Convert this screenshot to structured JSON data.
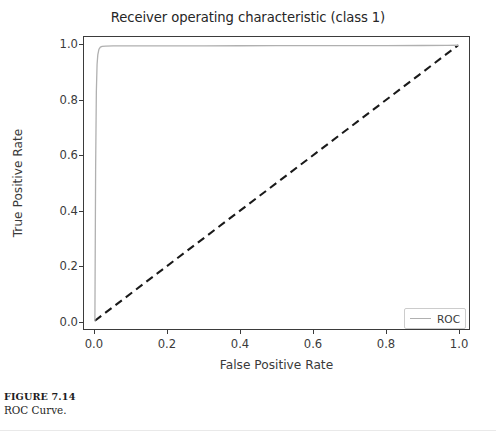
{
  "figure": {
    "caption_number": "FIGURE 7.14",
    "caption_text": "ROC Curve."
  },
  "chart_data": {
    "type": "line",
    "title": "Receiver operating characteristic (class 1)",
    "xlabel": "False Positive Rate",
    "ylabel": "True Positive Rate",
    "xlim": [
      -0.03,
      1.03
    ],
    "ylim": [
      -0.03,
      1.03
    ],
    "xticks": [
      0.0,
      0.2,
      0.4,
      0.6,
      0.8,
      1.0
    ],
    "yticks": [
      0.0,
      0.2,
      0.4,
      0.6,
      0.8,
      1.0
    ],
    "xtick_labels": [
      "0.0",
      "0.2",
      "0.4",
      "0.6",
      "0.8",
      "1.0"
    ],
    "ytick_labels": [
      "0.0",
      "0.2",
      "0.4",
      "0.6",
      "0.8",
      "1.0"
    ],
    "grid": false,
    "legend_position": "lower right",
    "series": [
      {
        "name": "ROC",
        "style": "solid",
        "color": "#b0b0b0",
        "linewidth": 1.3,
        "x": [
          0.0,
          0.002,
          0.004,
          0.006,
          0.008,
          0.011,
          0.015,
          0.02,
          0.03,
          0.05,
          0.1,
          0.2,
          0.3,
          0.4,
          0.5,
          0.6,
          0.7,
          0.8,
          0.9,
          0.97,
          1.0
        ],
        "y": [
          0.0,
          0.55,
          0.83,
          0.93,
          0.965,
          0.985,
          0.993,
          0.996,
          0.997,
          0.9975,
          0.998,
          0.998,
          0.998,
          0.9982,
          0.9984,
          0.9986,
          0.9988,
          0.999,
          0.9992,
          0.9996,
          1.0
        ]
      },
      {
        "name": "chance",
        "style": "dashed",
        "color": "#1a1a1a",
        "linewidth": 2.1,
        "x": [
          0.0,
          1.0
        ],
        "y": [
          0.0,
          1.0
        ]
      }
    ],
    "legend_entries": [
      {
        "label": "ROC",
        "color": "#b0b0b0",
        "style": "solid"
      }
    ]
  }
}
